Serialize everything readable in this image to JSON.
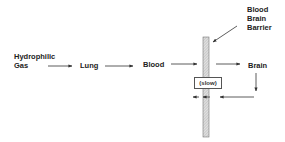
{
  "diagram": {
    "nodes": {
      "source": {
        "line1": "Hydrophilic",
        "line2": "Gas"
      },
      "lung": "Lung",
      "blood": "Blood",
      "brain": "Brain",
      "barrier": {
        "line1": "Blood",
        "line2": "Brain",
        "line3": "Barrier"
      },
      "slow": "(slow)"
    },
    "edges": [
      {
        "from": "Hydrophilic Gas",
        "to": "Lung"
      },
      {
        "from": "Lung",
        "to": "Blood"
      },
      {
        "from": "Blood",
        "to": "Blood Brain Barrier"
      },
      {
        "from": "Blood Brain Barrier",
        "to": "Brain"
      },
      {
        "from": "Brain",
        "to": "Blood Brain Barrier",
        "note": "return path"
      },
      {
        "from": "Blood Brain Barrier",
        "to": "Blood",
        "note": "(slow)"
      }
    ],
    "colors": {
      "text": "#222222",
      "line": "#333333",
      "barrier_fill": "#d8d8d8"
    }
  }
}
